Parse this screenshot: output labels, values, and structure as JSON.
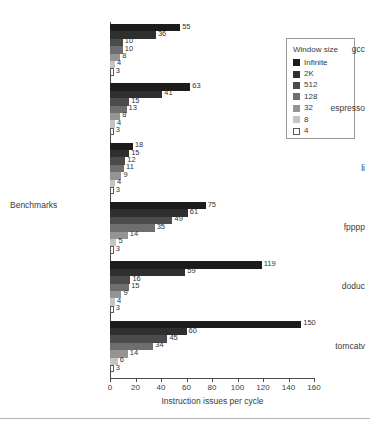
{
  "chart_data": {
    "type": "bar",
    "orientation": "horizontal",
    "title": "",
    "xlabel": "Instruction issues per cycle",
    "ylabel": "Benchmarks",
    "xlim": [
      0,
      160
    ],
    "xticks": [
      0,
      20,
      40,
      60,
      80,
      100,
      120,
      140,
      160
    ],
    "grid": false,
    "legend_title": "Window size",
    "legend_position": "right",
    "categories": [
      "gcc",
      "espresso",
      "li",
      "fpppp",
      "doduc",
      "tomcatv"
    ],
    "series": [
      {
        "name": "Infinite",
        "color": "#1c1c1c",
        "values": [
          55,
          63,
          18,
          75,
          119,
          150
        ]
      },
      {
        "name": "2K",
        "color": "#2f2f2f",
        "values": [
          36,
          41,
          15,
          61,
          59,
          60
        ]
      },
      {
        "name": "512",
        "color": "#4b4b4b",
        "values": [
          10,
          15,
          12,
          49,
          16,
          45
        ]
      },
      {
        "name": "128",
        "color": "#6e6e6e",
        "values": [
          10,
          13,
          11,
          35,
          15,
          34
        ]
      },
      {
        "name": "32",
        "color": "#949494",
        "values": [
          8,
          8,
          9,
          14,
          9,
          14
        ]
      },
      {
        "name": "8",
        "color": "#c4c4c4",
        "values": [
          4,
          4,
          4,
          5,
          4,
          6
        ]
      },
      {
        "name": "4",
        "color": "#ffffff",
        "values": [
          3,
          3,
          3,
          3,
          3,
          3
        ]
      }
    ]
  },
  "axis": {
    "x_tick_labels": [
      "0",
      "20",
      "40",
      "60",
      "80",
      "100",
      "120",
      "140",
      "160"
    ],
    "x_title": "Instruction issues per cycle",
    "y_title": "Benchmarks",
    "y_tick_labels": [
      "gcc",
      "espresso",
      "li",
      "fpppp",
      "doduc",
      "tomcatv"
    ]
  },
  "legend": {
    "title": "Window size",
    "items": [
      {
        "label": "Infinite",
        "color": "#1c1c1c"
      },
      {
        "label": "2K",
        "color": "#2f2f2f"
      },
      {
        "label": "512",
        "color": "#4b4b4b"
      },
      {
        "label": "128",
        "color": "#6e6e6e"
      },
      {
        "label": "32",
        "color": "#949494"
      },
      {
        "label": "8",
        "color": "#c4c4c4"
      },
      {
        "label": "4",
        "color": "#ffffff"
      }
    ]
  }
}
